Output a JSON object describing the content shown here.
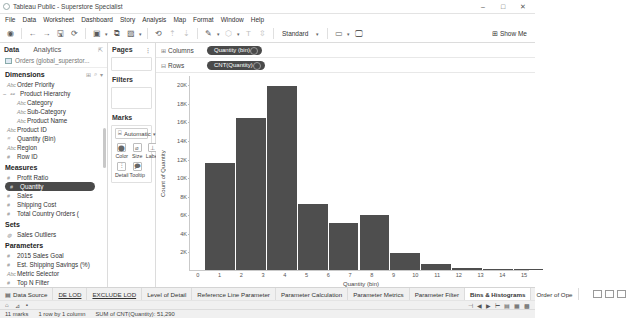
{
  "window": {
    "title": "Tableau Public - Superstore Specialist",
    "minimize": "–",
    "maximize": "□",
    "close": "✕"
  },
  "menubar": [
    {
      "label": "File"
    },
    {
      "label": "Data"
    },
    {
      "label": "Worksheet"
    },
    {
      "label": "Dashboard"
    },
    {
      "label": "Story"
    },
    {
      "label": "Analysis"
    },
    {
      "label": "Map"
    },
    {
      "label": "Format"
    },
    {
      "label": "Window"
    },
    {
      "label": "Help"
    }
  ],
  "toolbar": {
    "icons": [
      {
        "name": "tableau-logo-icon",
        "glyph": "◉"
      },
      {
        "name": "back-icon",
        "glyph": "←"
      },
      {
        "name": "forward-icon",
        "glyph": "→"
      },
      {
        "name": "save-icon",
        "glyph": "🖫"
      },
      {
        "name": "refresh-data-source-icon",
        "glyph": "⟳"
      },
      {
        "name": "new-worksheet-icon",
        "glyph": "▣"
      },
      {
        "name": "duplicate-sheet-icon",
        "glyph": "⧉"
      },
      {
        "name": "clear-sheet-icon",
        "glyph": "▨"
      },
      {
        "name": "swap-rows-columns-icon",
        "glyph": "⟲"
      },
      {
        "name": "sort-ascending-icon",
        "glyph": "⇡"
      },
      {
        "name": "sort-descending-icon",
        "glyph": "⇣"
      },
      {
        "name": "highlight-icon",
        "glyph": "✎"
      },
      {
        "name": "group-members-icon",
        "glyph": "⬡"
      },
      {
        "name": "show-mark-labels-icon",
        "glyph": "T"
      },
      {
        "name": "fix-axes-icon",
        "glyph": "⇳"
      }
    ],
    "fit_value": "Standard",
    "fit_caret": "▾",
    "presentation_icons": [
      {
        "name": "presentation-mode-icon",
        "glyph": "▭"
      },
      {
        "name": "device-preview-icon",
        "glyph": "🖵"
      }
    ],
    "show_me_label": "Show Me",
    "show_me_icon": "⊞"
  },
  "data_pane": {
    "tab_data": "Data",
    "tab_analytics": "Analytics",
    "pin_icon": "⇱",
    "data_source": "Orders (global_superstor...",
    "dimensions": {
      "title": "Dimensions",
      "tool_icons": [
        "⊞",
        "⌕",
        "▾"
      ],
      "items": [
        {
          "label": "Order Priority",
          "type": "Abc",
          "indent": false,
          "expander": ""
        },
        {
          "label": "Product Hierarchy",
          "type": "⚯",
          "indent": false,
          "expander": "−"
        },
        {
          "label": "Category",
          "type": "Abc",
          "indent": true,
          "expander": ""
        },
        {
          "label": "Sub-Category",
          "type": "Abc",
          "indent": true,
          "expander": ""
        },
        {
          "label": "Product Name",
          "type": "Abc",
          "indent": true,
          "expander": ""
        },
        {
          "label": "Product ID",
          "type": "Abc",
          "indent": false,
          "expander": ""
        },
        {
          "label": "Quantity (Bin)",
          "type": "⌗",
          "indent": false,
          "expander": ""
        },
        {
          "label": "Region",
          "type": "Abc",
          "indent": false,
          "expander": ""
        },
        {
          "label": "Row ID",
          "type": "#",
          "indent": false,
          "expander": ""
        }
      ]
    },
    "measures": {
      "title": "Measures",
      "items": [
        {
          "label": "Profit Ratio",
          "type": "#",
          "selected": false
        },
        {
          "label": "Quantity",
          "type": "#",
          "selected": true
        },
        {
          "label": "Sales",
          "type": "#",
          "selected": false
        },
        {
          "label": "Shipping Cost",
          "type": "#",
          "selected": false
        },
        {
          "label": "Total Country Orders (",
          "type": "#",
          "selected": false
        }
      ]
    },
    "sets": {
      "title": "Sets",
      "items": [
        {
          "label": "Sales Outliers",
          "type": "◍"
        }
      ]
    },
    "parameters": {
      "title": "Parameters",
      "items": [
        {
          "label": "2015 Sales Goal",
          "type": "#"
        },
        {
          "label": "Est. Shipping Savings (%)",
          "type": "#"
        },
        {
          "label": "Metric Selector",
          "type": "Abc"
        },
        {
          "label": "Top N Filter",
          "type": "#"
        }
      ]
    }
  },
  "pages_card": {
    "title": "Pages",
    "dots": "⋮"
  },
  "filters_card": {
    "title": "Filters"
  },
  "marks_card": {
    "title": "Marks",
    "mark_type": "Automatic",
    "mark_type_icon": "⌸",
    "caret": "▾",
    "buttons": [
      {
        "label": "Color",
        "icon": "color-icon",
        "glyph": "⬤"
      },
      {
        "label": "Size",
        "icon": "size-icon",
        "glyph": "⌀"
      },
      {
        "label": "Label",
        "icon": "label-icon",
        "glyph": "⊥"
      },
      {
        "label": "Detail",
        "icon": "detail-icon",
        "glyph": "⫶"
      },
      {
        "label": "Tooltip",
        "icon": "tooltip-icon",
        "glyph": "🗩"
      }
    ]
  },
  "shelves": {
    "columns_label": "Columns",
    "columns_icon": "⊞",
    "columns_pill": "Quantity (bin)",
    "rows_label": "Rows",
    "rows_icon": "⊟",
    "rows_pill": "CNT(Quantity)"
  },
  "chart_data": {
    "type": "bar",
    "title": "",
    "xlabel": "Quantity (bin)",
    "ylabel": "Count of Quantity",
    "categories": [
      "0",
      "1",
      "2",
      "3",
      "4",
      "5",
      "6",
      "7",
      "8",
      "9",
      "10",
      "11",
      "12",
      "13",
      "14",
      "15"
    ],
    "xticks": [
      "0",
      "1",
      "2",
      "3",
      "4",
      "5",
      "6",
      "7",
      "8",
      "9",
      "10",
      "11",
      "12",
      "13",
      "14",
      "15"
    ],
    "yticks": [
      "20K",
      "18K",
      "16K",
      "14K",
      "12K",
      "10K",
      "8K",
      "6K",
      "4K",
      "2K"
    ],
    "ytick_values": [
      20000,
      18000,
      16000,
      14000,
      12000,
      10000,
      8000,
      6000,
      4000,
      2000
    ],
    "ylim": [
      0,
      21000
    ],
    "xlim": [
      0,
      16
    ],
    "grid": false,
    "legend": "none",
    "bar_color": "#4e4e4e",
    "bins": [
      {
        "bin_start": 1,
        "bin_end": 3,
        "value": 11600
      },
      {
        "bin_start": 3,
        "bin_end": 5,
        "value": 16500
      },
      {
        "bin_start": 5,
        "bin_end": 7,
        "value": 19900
      },
      {
        "bin_start": 7,
        "bin_end": 9,
        "value": 7200
      },
      {
        "bin_start": 9,
        "bin_end": 11,
        "value": 5100
      },
      {
        "bin_start": 11,
        "bin_end": 13,
        "value": 6000
      },
      {
        "bin_start": 13,
        "bin_end": 15,
        "value": 1800
      },
      {
        "bin_start": 15,
        "bin_end": 17,
        "value": 600
      },
      {
        "bin_start": 17,
        "bin_end": 19,
        "value": 200
      },
      {
        "bin_start": 19,
        "bin_end": 21,
        "value": 100
      },
      {
        "bin_start": 21,
        "bin_end": 23,
        "value": 80
      }
    ]
  },
  "tabbar": {
    "items": [
      {
        "label": "Data Source",
        "icon": "data-source-icon",
        "active": false
      },
      {
        "label": "DE LOD",
        "active": false
      },
      {
        "label": "EXCLUDE LOD",
        "active": false
      },
      {
        "label": "Level of Detail",
        "active": false
      },
      {
        "label": "Reference Line Parameter",
        "active": false
      },
      {
        "label": "Parameter Calculation",
        "active": false
      },
      {
        "label": "Parameter Metrics",
        "active": false
      },
      {
        "label": "Parameter Filter",
        "active": false
      },
      {
        "label": "Bins & Histograms",
        "active": true
      },
      {
        "label": "Order of Ope",
        "active": false
      }
    ],
    "right_icons": [
      {
        "name": "new-worksheet-tab-icon",
        "glyph": "▤"
      },
      {
        "name": "new-dashboard-tab-icon",
        "glyph": "▦"
      },
      {
        "name": "new-story-tab-icon",
        "glyph": "▥"
      }
    ]
  },
  "statusbar": {
    "marks": "11 marks",
    "rows_cols": "1 row by 1 column",
    "aggregate": "SUM of CNT(Quantity): 51,290"
  },
  "navrow": {
    "left_icons": [
      "⌂",
      "⊿"
    ],
    "center": "▪",
    "right_icons": [
      "⊣",
      "◀",
      "▶",
      "⊢",
      "▤",
      "▦",
      "▩"
    ]
  }
}
